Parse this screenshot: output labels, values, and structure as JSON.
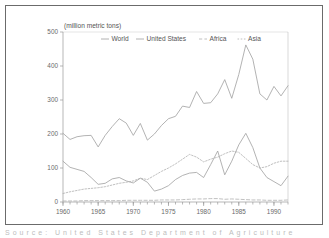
{
  "figure": {
    "yaxis_unit_label": "(million metric tons)",
    "caption_clipped": "Source: United States Department of Agriculture"
  },
  "colors": {
    "frame": "#6b6b6b",
    "axis": "#9a9a9a",
    "text": "#555555",
    "series_world": "#a0a0a0",
    "series_united_states": "#a0a0a0",
    "series_africa": "#b0b0b0",
    "series_asia": "#b0b0b0",
    "background": "#ffffff"
  },
  "chart_data": {
    "type": "line",
    "title": "",
    "xlabel": "",
    "ylabel": "(million metric tons)",
    "xlim": [
      1960,
      1992
    ],
    "ylim": [
      0,
      500
    ],
    "yticks": [
      0,
      100,
      200,
      300,
      400,
      500
    ],
    "ytick_labels": [
      "0",
      "100",
      "200",
      "300",
      "400",
      "500"
    ],
    "xticks": [
      1960,
      1965,
      1970,
      1975,
      1980,
      1985,
      1990
    ],
    "xtick_labels": [
      "1960",
      "1965",
      "1970",
      "1975",
      "1980",
      "1985",
      "1990"
    ],
    "minor_xticks_interval": 1,
    "grid": false,
    "legend_position": "top-center",
    "x": [
      1960,
      1961,
      1962,
      1963,
      1964,
      1965,
      1966,
      1967,
      1968,
      1969,
      1970,
      1971,
      1972,
      1973,
      1974,
      1975,
      1976,
      1977,
      1978,
      1979,
      1980,
      1981,
      1982,
      1983,
      1984,
      1985,
      1986,
      1987,
      1988,
      1989,
      1990,
      1991,
      1992
    ],
    "series": [
      {
        "name": "World",
        "line_style": "solid",
        "values": [
          202,
          184,
          192,
          195,
          196,
          162,
          196,
          222,
          245,
          232,
          196,
          231,
          182,
          200,
          225,
          245,
          252,
          282,
          278,
          325,
          290,
          292,
          318,
          360,
          305,
          375,
          462,
          420,
          318,
          300,
          340,
          312,
          342
        ]
      },
      {
        "name": "United States",
        "line_style": "solid",
        "values": [
          120,
          102,
          96,
          90,
          72,
          52,
          55,
          68,
          72,
          62,
          56,
          70,
          58,
          32,
          38,
          48,
          66,
          78,
          85,
          87,
          72,
          110,
          150,
          80,
          120,
          168,
          202,
          160,
          100,
          72,
          60,
          48,
          76
        ]
      },
      {
        "name": "Africa",
        "line_style": "dashed",
        "values": [
          3,
          3,
          3,
          4,
          4,
          4,
          4,
          4,
          4,
          5,
          5,
          5,
          5,
          5,
          6,
          6,
          6,
          7,
          8,
          9,
          9,
          10,
          10,
          8,
          9,
          8,
          7,
          6,
          6,
          5,
          5,
          5,
          6
        ]
      },
      {
        "name": "Asia",
        "line_style": "dotted",
        "values": [
          25,
          30,
          34,
          38,
          40,
          42,
          45,
          50,
          55,
          58,
          62,
          70,
          66,
          78,
          90,
          100,
          112,
          126,
          140,
          132,
          118,
          126,
          132,
          142,
          150,
          146,
          128,
          110,
          100,
          104,
          114,
          120,
          120
        ]
      }
    ]
  },
  "legend": {
    "items": [
      {
        "label": "World",
        "style": "solid"
      },
      {
        "label": "United States",
        "style": "solid"
      },
      {
        "label": "Africa",
        "style": "dashed"
      },
      {
        "label": "Asia",
        "style": "dotted"
      }
    ]
  }
}
